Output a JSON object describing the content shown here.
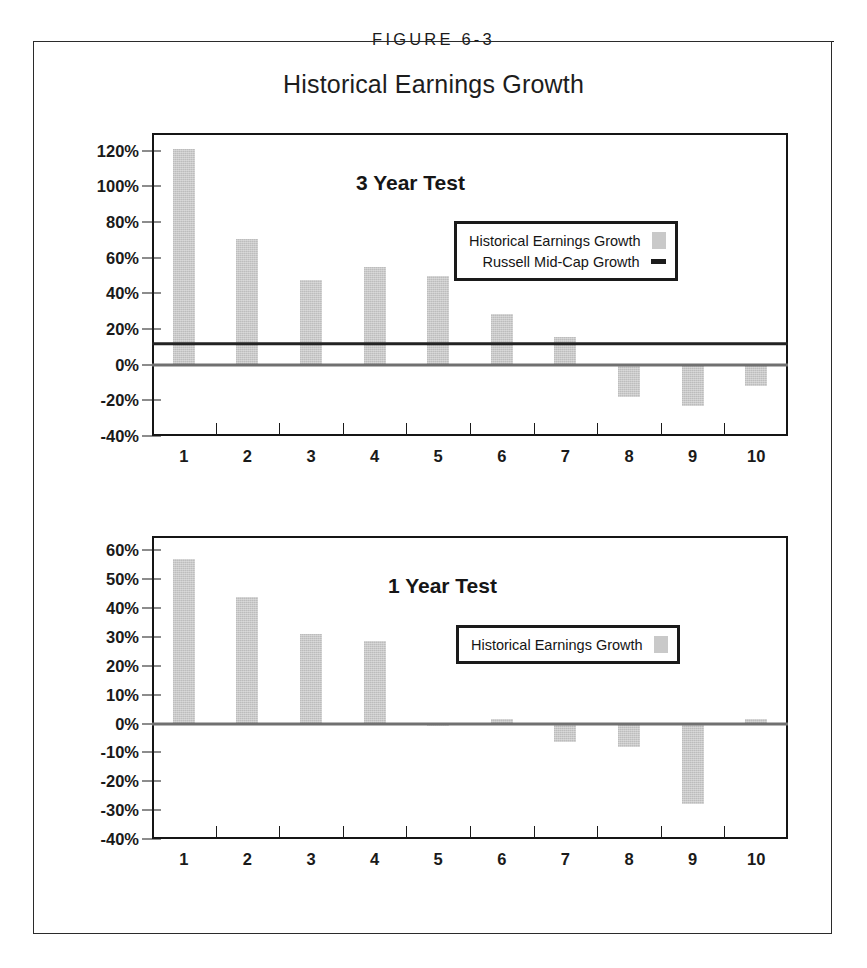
{
  "figure": {
    "label": "FIGURE 6-3",
    "title": "Historical Earnings Growth"
  },
  "colors": {
    "bar_fill": "#c9c9c9",
    "benchmark_line": "#232323",
    "zero_line": "#707070",
    "frame": "#151515",
    "text": "#1a1a1a"
  },
  "chart_data": [
    {
      "type": "bar",
      "id": "3-year-test",
      "title": "3 Year Test",
      "xlabel": "",
      "ylabel": "",
      "categories": [
        "1",
        "2",
        "3",
        "4",
        "5",
        "6",
        "7",
        "8",
        "9",
        "10"
      ],
      "series": [
        {
          "name": "Historical Earnings Growth",
          "marker": "swatch",
          "values": [
            121,
            70.5,
            47.5,
            55,
            50,
            28.5,
            15.5,
            -18,
            -23,
            -12
          ]
        }
      ],
      "reference_line": {
        "name": "Russell Mid-Cap Growth",
        "marker": "line",
        "value": 11.5
      },
      "ylim": [
        -40,
        130
      ],
      "yticks": [
        120,
        100,
        80,
        60,
        40,
        20,
        0,
        -20,
        -40
      ],
      "ytick_labels": [
        "120%",
        "100%",
        "80%",
        "60%",
        "40%",
        "20%",
        "0%",
        "-20%",
        "-40%"
      ],
      "grid": false,
      "legend_position": "upper-right",
      "legend_entries": [
        "Historical Earnings Growth",
        "Russell Mid-Cap Growth"
      ]
    },
    {
      "type": "bar",
      "id": "1-year-test",
      "title": "1 Year Test",
      "xlabel": "",
      "ylabel": "",
      "categories": [
        "1",
        "2",
        "3",
        "4",
        "5",
        "6",
        "7",
        "8",
        "9",
        "10"
      ],
      "series": [
        {
          "name": "Historical Earnings Growth",
          "marker": "swatch",
          "values": [
            57,
            44,
            31,
            28.5,
            -1,
            1.5,
            -6.5,
            -8,
            -28,
            1.5
          ]
        }
      ],
      "ylim": [
        -40,
        65
      ],
      "yticks": [
        60,
        50,
        40,
        30,
        20,
        10,
        0,
        -10,
        -20,
        -30,
        -40
      ],
      "ytick_labels": [
        "60%",
        "50%",
        "40%",
        "30%",
        "20%",
        "10%",
        "0%",
        "-10%",
        "-20%",
        "-30%",
        "-40%"
      ],
      "grid": false,
      "legend_position": "upper-right",
      "legend_entries": [
        "Historical Earnings Growth"
      ]
    }
  ]
}
